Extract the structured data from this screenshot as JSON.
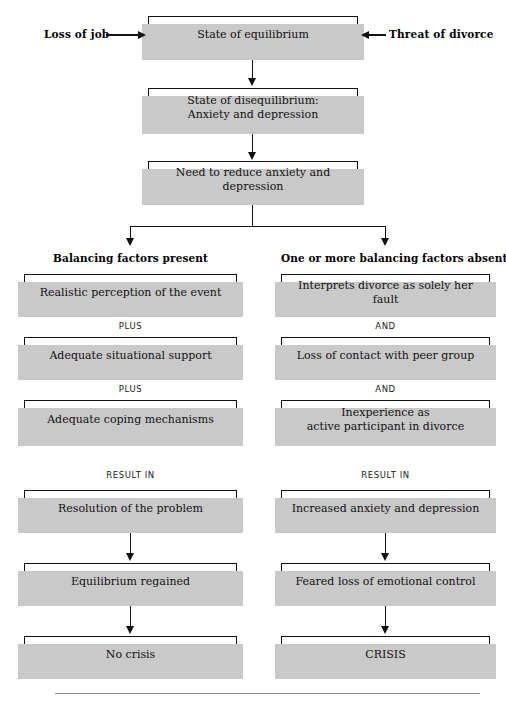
{
  "figure": {
    "stressor_labels": {
      "left": "Loss of job",
      "right": "Threat of divorce"
    },
    "trunk": [
      {
        "id": "equilibrium",
        "text": "State of equilibrium"
      },
      {
        "id": "disequilibrium",
        "line1": "State of disequilibrium:",
        "line2": "Anxiety and depression"
      },
      {
        "id": "need-reduce",
        "text": "Need to reduce anxiety and depression"
      }
    ],
    "columns": [
      {
        "id": "balancing-present",
        "heading": "Balancing factors present",
        "steps": [
          {
            "text": "Realistic perception of the event"
          },
          {
            "text": "Adequate situational support"
          },
          {
            "text": "Adequate coping mechanisms"
          },
          {
            "text": "Resolution of the problem"
          },
          {
            "text": "Equilibrium regained"
          },
          {
            "text": "No crisis"
          }
        ],
        "connectors": [
          "PLUS",
          "PLUS",
          "RESULT IN"
        ]
      },
      {
        "id": "balancing-absent",
        "heading": "One or more balancing factors absent",
        "steps": [
          {
            "text": "Interprets divorce as solely her fault"
          },
          {
            "text": "Loss of contact with peer group"
          },
          {
            "line1": "Inexperience as",
            "line2": "active participant in divorce"
          },
          {
            "text": "Increased anxiety and depression"
          },
          {
            "text": "Feared loss of emotional control"
          },
          {
            "text": "CRISIS"
          }
        ],
        "connectors": [
          "AND",
          "AND",
          "RESULT IN"
        ]
      }
    ],
    "colors": {
      "box_border": "#111111",
      "box_fill": "#ffffff",
      "shadow": "#c9c9c9",
      "line": "#111111",
      "rule": "#8c8c8c",
      "background": "#ffffff"
    }
  }
}
